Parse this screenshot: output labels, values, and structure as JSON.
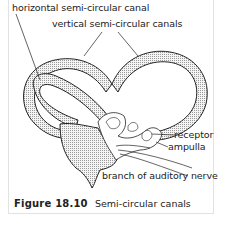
{
  "labels": {
    "horizontal_canal": "horizontal semi-circular canal",
    "vertical_canals": "vertical semi-circular canals",
    "receptor": "receptor",
    "ampulla": "ampulla",
    "auditory_nerve": "branch of auditory nerve"
  },
  "caption": {
    "figure_number": "Figure 18.10",
    "title": "Semi-circular canals"
  },
  "colors": {
    "outline": "#222222",
    "stipple": "#bdbdbd",
    "frame": "#e2e2e2"
  }
}
